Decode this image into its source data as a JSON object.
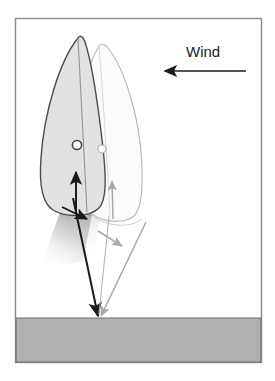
{
  "figure": {
    "annotations": {
      "wind_label": "Wind"
    },
    "colors": {
      "frame_border": "#8a8a8a",
      "background": "#ffffff",
      "ground_fill": "#b0b0b0",
      "ground_border": "#6e6e6e",
      "sail_dark_fill": "#e2e2e2",
      "sail_dark_stroke": "#4d4d4d",
      "sail_light_fill": "#fbfbfb",
      "sail_light_stroke": "#b9b9b9",
      "arrow_dark": "#1a1a1a",
      "arrow_light": "#a8a8a8",
      "shadow": "#9a9a9a"
    },
    "elements": {
      "frame": "outer-rectangle-border",
      "ground": "gray-ground-band",
      "sail_current": "dark-outlined-filled-sail",
      "sail_previous": "light-outlined-sail",
      "porthole_current": "dark-ring-circle",
      "porthole_previous": "light-ring-circle",
      "lift_vector_current": "dark-up-arrow",
      "lift_vector_previous": "light-up-arrow",
      "short_vector_current": "dark-short-down-right-arrow",
      "short_vector_previous": "light-short-down-right-arrow",
      "line_to_ground_current": "dark-long-diagonal-arrow",
      "line_to_ground_previous": "light-long-diagonal-arrow",
      "wind_arrow": "left-pointing-arrow",
      "wake": "gradient-shadow-cone"
    }
  }
}
